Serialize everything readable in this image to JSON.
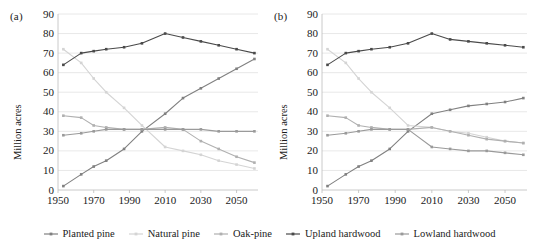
{
  "figure": {
    "panels": [
      {
        "tag": "(a)",
        "ylabel": "Million acres"
      },
      {
        "tag": "(b)",
        "ylabel": "Million acres"
      }
    ],
    "legend": [
      {
        "label": "Planted pine",
        "color": "#808080"
      },
      {
        "label": "Natural pine",
        "color": "#d4d4d4"
      },
      {
        "label": "Oak-pine",
        "color": "#b0b0b0"
      },
      {
        "label": "Upland hardwood",
        "color": "#4a4a4a"
      },
      {
        "label": "Lowland hardwood",
        "color": "#9a9a9a"
      }
    ]
  },
  "chart_data": [
    {
      "type": "line",
      "title": "(a)",
      "xlabel": "",
      "ylabel": "Million acres",
      "xlim": [
        1950,
        2062
      ],
      "ylim": [
        0,
        90
      ],
      "ytick_labels": [
        "0",
        "10",
        "20",
        "30",
        "40",
        "50",
        "60",
        "70",
        "80",
        "90"
      ],
      "yticks": [
        0,
        10,
        20,
        30,
        40,
        50,
        60,
        70,
        80,
        90
      ],
      "xtick_labels": [
        "1950",
        "1970",
        "1990",
        "2010",
        "2030",
        "2050"
      ],
      "xticks": [
        1950,
        1970,
        1990,
        2010,
        2030,
        2050
      ],
      "grid": "horizontal",
      "legend_position": "bottom-shared",
      "x": [
        1953,
        1963,
        1970,
        1977,
        1987,
        1997,
        2010,
        2020,
        2030,
        2040,
        2050,
        2060
      ],
      "series": [
        {
          "name": "Planted pine",
          "color": "#808080",
          "values": [
            2,
            8,
            12,
            15,
            21,
            30,
            39,
            47,
            52,
            57,
            62,
            67
          ]
        },
        {
          "name": "Natural pine",
          "color": "#d4d4d4",
          "values": [
            72,
            65,
            57,
            50,
            42,
            33,
            22,
            20,
            18,
            15,
            13,
            11
          ]
        },
        {
          "name": "Oak-pine",
          "color": "#b0b0b0",
          "values": [
            38,
            37,
            33,
            32,
            31,
            31,
            32,
            31,
            25,
            21,
            17,
            14
          ]
        },
        {
          "name": "Upland hardwood",
          "color": "#4a4a4a",
          "values": [
            64,
            70,
            71,
            72,
            73,
            75,
            80,
            78,
            76,
            74,
            72,
            70
          ]
        },
        {
          "name": "Lowland hardwood",
          "color": "#9a9a9a",
          "values": [
            28,
            29,
            30,
            31,
            31,
            31,
            31,
            31,
            31,
            30,
            30,
            30
          ]
        }
      ]
    },
    {
      "type": "line",
      "title": "(b)",
      "xlabel": "",
      "ylabel": "Million acres",
      "xlim": [
        1950,
        2062
      ],
      "ylim": [
        0,
        90
      ],
      "ytick_labels": [
        "0",
        "10",
        "20",
        "30",
        "40",
        "50",
        "60",
        "70",
        "80",
        "90"
      ],
      "yticks": [
        0,
        10,
        20,
        30,
        40,
        50,
        60,
        70,
        80,
        90
      ],
      "xtick_labels": [
        "1950",
        "1970",
        "1990",
        "2010",
        "2030",
        "2050"
      ],
      "xticks": [
        1950,
        1970,
        1990,
        2010,
        2030,
        2050
      ],
      "grid": "horizontal",
      "legend_position": "bottom-shared",
      "x": [
        1953,
        1963,
        1970,
        1977,
        1987,
        1997,
        2010,
        2020,
        2030,
        2040,
        2050,
        2060
      ],
      "series": [
        {
          "name": "Planted pine",
          "color": "#808080",
          "values": [
            2,
            8,
            12,
            15,
            21,
            30,
            39,
            41,
            43,
            44,
            45,
            47
          ]
        },
        {
          "name": "Natural pine",
          "color": "#d4d4d4",
          "values": [
            72,
            65,
            57,
            50,
            42,
            33,
            32,
            30,
            29,
            27,
            25,
            24
          ]
        },
        {
          "name": "Oak-pine",
          "color": "#b0b0b0",
          "values": [
            38,
            37,
            33,
            32,
            31,
            31,
            32,
            30,
            28,
            26,
            25,
            24
          ]
        },
        {
          "name": "Upland hardwood",
          "color": "#4a4a4a",
          "values": [
            64,
            70,
            71,
            72,
            73,
            75,
            80,
            77,
            76,
            75,
            74,
            73
          ]
        },
        {
          "name": "Lowland hardwood",
          "color": "#9a9a9a",
          "values": [
            28,
            29,
            30,
            31,
            31,
            31,
            22,
            21,
            20,
            20,
            19,
            18
          ]
        }
      ]
    }
  ]
}
